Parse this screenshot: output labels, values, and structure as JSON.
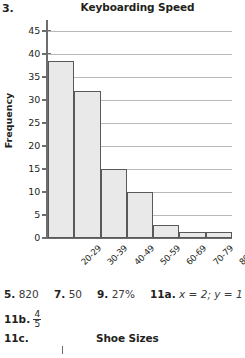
{
  "problem_number": "3.",
  "chart_data": {
    "type": "bar",
    "title": "Keyboarding Speed",
    "xlabel": "",
    "ylabel": "Frequency",
    "categories": [
      "20-29",
      "30-39",
      "40-49",
      "50-59",
      "60-69",
      "70-79",
      "80-89"
    ],
    "values": [
      38.5,
      32,
      15,
      10,
      2.8,
      1.4,
      1.4
    ],
    "yticks": [
      0,
      5,
      10,
      15,
      20,
      25,
      30,
      35,
      40,
      45
    ],
    "ylim": [
      0,
      48
    ],
    "grid": true,
    "legend": "none",
    "bar_fill": "#e9e9e9",
    "bar_border": "#58595b",
    "gridline_color": "#b9b9b9",
    "axis_color": "#6d6d6d"
  },
  "answers": {
    "row1": [
      {
        "num": "5.",
        "val": "820"
      },
      {
        "num": "7.",
        "val": "50"
      },
      {
        "num": "9.",
        "val": "27%"
      },
      {
        "num": "11a.",
        "val": "x = 2; y = 1"
      }
    ],
    "row2": {
      "num": "11b.",
      "numerator": "4",
      "denominator": "5"
    },
    "row3": {
      "num": "11c.",
      "chart_title": "Shoe Sizes"
    }
  }
}
